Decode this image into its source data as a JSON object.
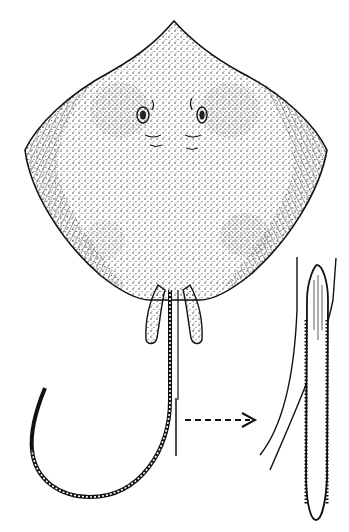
{
  "figure": {
    "style": "stipple ink drawing",
    "colors": {
      "background": "#ffffff",
      "ink": "#111111"
    },
    "parts": [
      {
        "name": "disc",
        "description": "rhomboid body with stippled dorsal surface"
      },
      {
        "name": "pelvic-fins",
        "description": "paired claspers below disc"
      },
      {
        "name": "tail",
        "description": "long whip-like tail curving left"
      },
      {
        "name": "detail-arrow",
        "description": "dashed arrow pointing to spine detail"
      },
      {
        "name": "spine-detail",
        "description": "enlarged serrated tail spine inset"
      }
    ]
  }
}
